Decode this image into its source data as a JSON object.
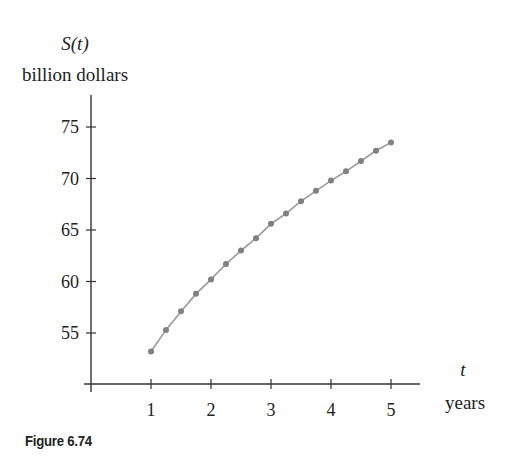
{
  "figure": {
    "caption": "Figure 6.74"
  },
  "chart_data": {
    "type": "line",
    "title": "",
    "ylabel_top": "S(t)",
    "ylabel": "billion dollars",
    "xlabel_top": "t",
    "xlabel": "years",
    "x_ticks": [
      1,
      2,
      3,
      4,
      5
    ],
    "y_ticks": [
      55,
      60,
      65,
      70,
      75
    ],
    "xlim": [
      0,
      5.5
    ],
    "ylim": [
      49.9,
      77
    ],
    "grid": false,
    "markers": true,
    "colors": {
      "line": "#9a9a9a",
      "marker": "#808080",
      "axis": "#333333"
    },
    "x": [
      1,
      1.25,
      1.5,
      1.75,
      2,
      2.25,
      2.5,
      2.75,
      3,
      3.25,
      3.5,
      3.75,
      4,
      4.25,
      4.5,
      4.75,
      5
    ],
    "series": [
      {
        "name": "S(t)",
        "values": [
          53.2,
          55.3,
          57.1,
          58.8,
          60.2,
          61.7,
          63.0,
          64.2,
          65.6,
          66.6,
          67.8,
          68.8,
          69.8,
          70.7,
          71.7,
          72.7,
          73.5
        ]
      }
    ]
  }
}
